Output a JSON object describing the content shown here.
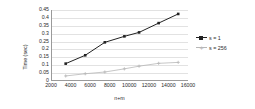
{
  "chart_data": {
    "type": "line",
    "title": "",
    "xlabel": "n+m",
    "ylabel": "Time (sec)",
    "xlim": [
      2000,
      16000
    ],
    "ylim": [
      0,
      0.45
    ],
    "xticks": [
      2000,
      4000,
      6000,
      8000,
      10000,
      12000,
      14000,
      16000
    ],
    "yticks": [
      "0",
      "0.05",
      "0.1",
      "0.15",
      "0.2",
      "0.25",
      "0.3",
      "0.35",
      "0.4",
      "0.45"
    ],
    "grid": true,
    "legend_position": "right",
    "series": [
      {
        "name": "s = 1",
        "color": "#222222",
        "marker": "square",
        "x": [
          3500,
          5500,
          7500,
          9500,
          11000,
          13000,
          15000
        ],
        "values": [
          0.11,
          0.163,
          0.245,
          0.283,
          0.308,
          0.367,
          0.425
        ]
      },
      {
        "name": "s = 256",
        "color": "#b7b7b7",
        "marker": "cross",
        "x": [
          3500,
          5500,
          7500,
          9500,
          11000,
          13000,
          15000
        ],
        "values": [
          0.032,
          0.046,
          0.057,
          0.077,
          0.094,
          0.112,
          0.118
        ]
      }
    ]
  },
  "legend": {
    "items": [
      {
        "label": "s = 1"
      },
      {
        "label": "s = 256"
      }
    ]
  },
  "axes": {
    "y_title": "Time (sec)",
    "x_title": "n+m"
  },
  "colors": {
    "series1": "#222222",
    "series2": "#b7b7b7",
    "grid": "#e2e2e2",
    "axis": "#9a9a9a",
    "background": "#ffffff",
    "text": "#2b2b2b"
  }
}
